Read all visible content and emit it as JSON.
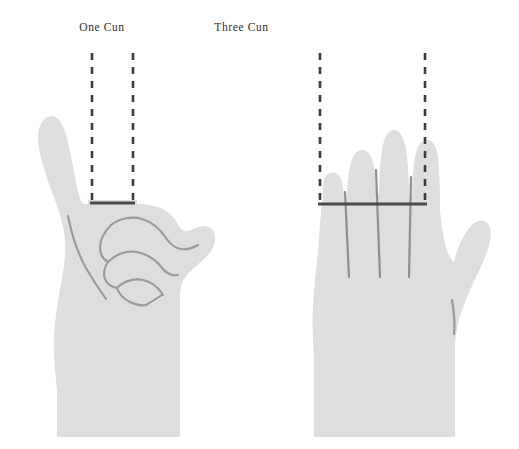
{
  "figure": {
    "background_color": "#ffffff",
    "hand_fill_color": "#dedede",
    "crease_line_color": "#9a9a9a",
    "measure_line_color": "#4a4a4a",
    "dashed_line_color": "#3c3c3c",
    "title_color": "#2f3032",
    "width": 519,
    "height": 449
  },
  "panels": [
    {
      "id": "one-cun",
      "title": "One Cun",
      "hand_pose": "closed-fist-thumb-up",
      "measure_span_label": "one finger width",
      "dashed_guides": 2,
      "finger_divider_lines": 0
    },
    {
      "id": "three-cun",
      "title": "Three Cun",
      "hand_pose": "open-palm-four-fingers",
      "measure_span_label": "four finger widths",
      "dashed_guides": 2,
      "finger_divider_lines": 3
    }
  ]
}
